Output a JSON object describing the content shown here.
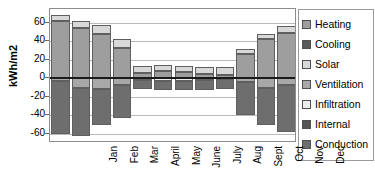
{
  "chart_data": {
    "type": "bar",
    "title": "",
    "xlabel": "",
    "ylabel": "kWh/m2",
    "ylim": [
      -70,
      75
    ],
    "yticks": [
      60,
      40,
      20,
      0,
      -20,
      -40,
      -60
    ],
    "grid": true,
    "stacked": true,
    "legend_position": "right",
    "categories": [
      "Jan",
      "Feb",
      "Mar",
      "April",
      "May",
      "June",
      "July",
      "Aug",
      "Sept",
      "Oct",
      "Nov",
      "Dec"
    ],
    "series": [
      {
        "name": "Heating",
        "color": "#9e9e9e",
        "values": [
          62,
          54,
          48,
          33,
          6,
          8,
          7,
          5,
          4,
          26,
          42,
          49
        ]
      },
      {
        "name": "Cooling",
        "color": "#595959",
        "values": [
          0,
          0,
          0,
          0,
          0,
          0,
          0,
          0,
          0,
          0,
          0,
          0
        ]
      },
      {
        "name": "Solar",
        "color": "#d8d8d8",
        "values": [
          6,
          8,
          10,
          10,
          7,
          6,
          6,
          7,
          8,
          6,
          6,
          8
        ]
      },
      {
        "name": "Ventilation",
        "color": "#a8a8a8",
        "values": [
          -3,
          -10,
          -12,
          -7,
          0,
          0,
          0,
          0,
          0,
          -4,
          -10,
          -7
        ]
      },
      {
        "name": "Infiltration",
        "color": "#ededed",
        "values": [
          0,
          0,
          0,
          0,
          -2,
          -3,
          -3,
          -2,
          -1,
          0,
          0,
          0
        ]
      },
      {
        "name": "Internal",
        "color": "#555555",
        "values": [
          0,
          0,
          0,
          0,
          0,
          0,
          0,
          0,
          0,
          0,
          0,
          0
        ]
      },
      {
        "name": "Conduction",
        "color": "#6e6e6e",
        "values": [
          -57,
          -52,
          -38,
          -36,
          -10,
          -10,
          -10,
          -11,
          -11,
          -36,
          -40,
          -51
        ]
      }
    ],
    "legend_labels": [
      "Heating",
      "Cooling",
      "Solar",
      "Ventilation",
      "Infiltration",
      "Internal",
      "Conduction"
    ]
  }
}
